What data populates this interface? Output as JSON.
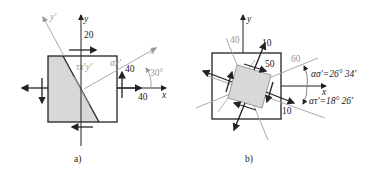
{
  "figure_a": {
    "caption": "a)",
    "axis_x": "x",
    "axis_y": "y",
    "axis_xp": "x′",
    "axis_yp": "y′",
    "stress_top": "20",
    "stress_right_shear": "40",
    "stress_right_normal": "40",
    "angle": "30°",
    "tau_label": "τx′y′",
    "sigma_label": "σx′"
  },
  "figure_b": {
    "caption": "b)",
    "axis_x": "x",
    "axis_y": "y",
    "label_40": "40",
    "label_60": "60",
    "label_50": "50",
    "label_10_top": "10",
    "label_10_bottom": "10",
    "alpha_sigma": "ασ′=26° 34′",
    "alpha_tau": "ατ′=18° 26′"
  },
  "colors": {
    "line": "#222222",
    "gray_line": "#a0a0a0",
    "fill": "#d8d8d8"
  }
}
